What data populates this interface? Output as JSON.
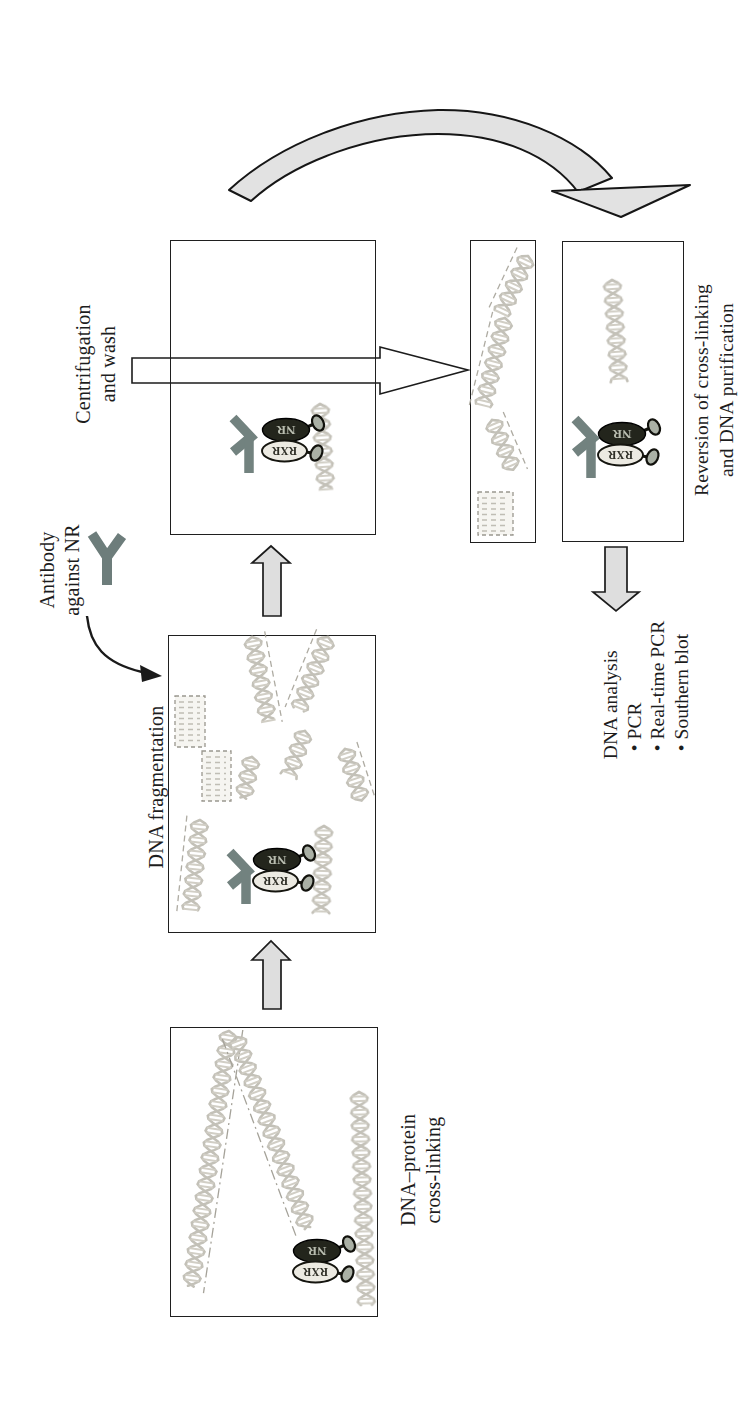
{
  "figure": {
    "steps": {
      "crosslinking_label": {
        "line1": "DNA–protein",
        "line2": "cross-linking"
      },
      "fragmentation_label": {
        "line1": "DNA fragmentation"
      },
      "antibody_label": {
        "line1": "Antibody",
        "line2": "against NR"
      },
      "centrifugation_label": {
        "line1": "Centrifugation",
        "line2": "and wash"
      },
      "reversion_label": {
        "line1": "Reversion of cross-linking",
        "line2": "and DNA purification"
      },
      "analysis": {
        "title": "DNA analysis",
        "items": [
          "PCR",
          "Real-time PCR",
          "Southern blot"
        ]
      }
    },
    "molecules": {
      "nr": "NR",
      "rxr": "RXR"
    },
    "colors": {
      "antibody_icon": "#72827f",
      "nr_fill": "#23251c",
      "rxr_fill": "#eceae2",
      "block_arrow_fill": "#dedede",
      "curved_arrow_fill": "#e2e2e2",
      "box_border": "#1f1f1f",
      "dna_strand": "#bdbab0"
    }
  }
}
